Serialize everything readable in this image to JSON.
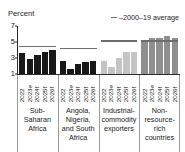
{
  "axis": {
    "unit_label": "Percent",
    "y_ticks": [
      7,
      5,
      3,
      1
    ],
    "y_min": 1,
    "y_max": 7
  },
  "legend": {
    "line_label": "–2000–19 average",
    "swatch_name": "average-line-swatch"
  },
  "colors": {
    "bars_black": "#181818",
    "bars_light_gray": "#c4c4c4",
    "bars_mid_gray": "#8f8f8f",
    "average_line": "#6e6e6e",
    "axis": "#2b2b2b",
    "separator": "#9a9a9a",
    "text": "#1a1a1a"
  },
  "chart_data": {
    "type": "bar",
    "title": "",
    "xlabel": "",
    "ylabel": "Percent",
    "ylim": [
      1,
      7
    ],
    "grid": false,
    "legend_position": "top-right",
    "legend_entries": [
      "–2000–19 average"
    ],
    "categories": [
      "2022",
      "2023e",
      "2024f",
      "2025f",
      "2026f"
    ],
    "groups": [
      {
        "name": "Sub-Saharan Africa",
        "label_lines": [
          "Sub-",
          "Saharan",
          "Africa"
        ],
        "color": "#181818",
        "values": [
          3.6,
          2.9,
          3.4,
          3.8,
          4.0
        ],
        "average_2000_19": 4.5
      },
      {
        "name": "Angola, Nigeria, and South Africa",
        "label_lines": [
          "Angola,",
          "Nigeria,",
          "and South",
          "Africa"
        ],
        "color": "#181818",
        "values": [
          2.6,
          1.6,
          2.3,
          2.5,
          2.6
        ],
        "average_2000_19": 4.3
      },
      {
        "name": "Industrial-commodity exporters",
        "label_lines": [
          "Industrial-",
          "commodity",
          "exporters"
        ],
        "color": "#c4c4c4",
        "values": [
          2.6,
          1.9,
          3.0,
          3.7,
          3.8
        ],
        "average_2000_19": 5.2
      },
      {
        "name": "Non-resource-rich countries",
        "label_lines": [
          "Non-",
          "resource-",
          "rich",
          "countries"
        ],
        "color": "#8f8f8f",
        "values": [
          5.2,
          5.5,
          5.5,
          5.7,
          5.5
        ],
        "average_2000_19": 5.2
      }
    ]
  }
}
